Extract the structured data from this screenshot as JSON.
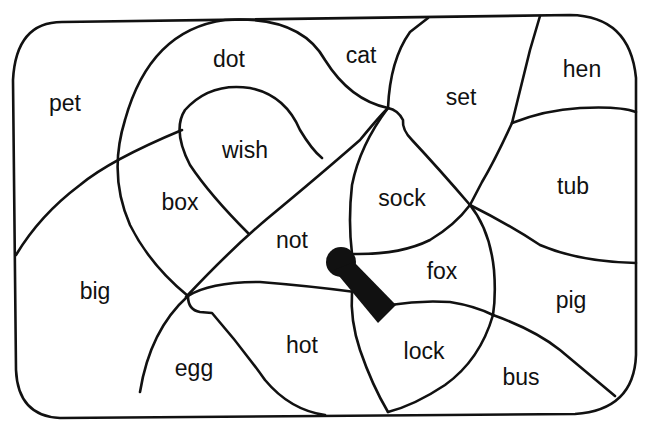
{
  "puzzle": {
    "line_color": "#111111",
    "background": "#ffffff",
    "words": [
      {
        "id": "pet",
        "label": "pet",
        "x": 65,
        "y": 103
      },
      {
        "id": "dot",
        "label": "dot",
        "x": 229,
        "y": 59
      },
      {
        "id": "cat",
        "label": "cat",
        "x": 361,
        "y": 55
      },
      {
        "id": "set",
        "label": "set",
        "x": 461,
        "y": 97
      },
      {
        "id": "hen",
        "label": "hen",
        "x": 582,
        "y": 69
      },
      {
        "id": "wish",
        "label": "wish",
        "x": 245,
        "y": 150
      },
      {
        "id": "box",
        "label": "box",
        "x": 180,
        "y": 202
      },
      {
        "id": "sock",
        "label": "sock",
        "x": 402,
        "y": 198
      },
      {
        "id": "tub",
        "label": "tub",
        "x": 573,
        "y": 186
      },
      {
        "id": "not",
        "label": "not",
        "x": 292,
        "y": 240
      },
      {
        "id": "fox",
        "label": "fox",
        "x": 442,
        "y": 271
      },
      {
        "id": "big",
        "label": "big",
        "x": 95,
        "y": 291
      },
      {
        "id": "pig",
        "label": "pig",
        "x": 571,
        "y": 300
      },
      {
        "id": "hot",
        "label": "hot",
        "x": 302,
        "y": 345
      },
      {
        "id": "lock",
        "label": "lock",
        "x": 424,
        "y": 351
      },
      {
        "id": "egg",
        "label": "egg",
        "x": 194,
        "y": 368
      },
      {
        "id": "bus",
        "label": "bus",
        "x": 521,
        "y": 377
      }
    ],
    "keyhole": {
      "label": "keyhole",
      "color": "#111111"
    }
  }
}
